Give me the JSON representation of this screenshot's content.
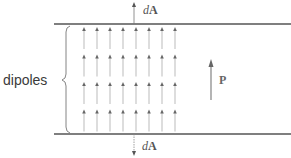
{
  "figure": {
    "labels": {
      "dipoles": "dipoles",
      "polarization": "P",
      "area_top_d": "d",
      "area_top_A": "A",
      "area_bottom_d": "d",
      "area_bottom_A": "A"
    },
    "colors": {
      "boundary_line": "#555555",
      "dipole_arrow": "#777777",
      "polarization_arrow": "#666666",
      "text": "#444444"
    },
    "dipole_grid": {
      "columns": 8,
      "rows": 4,
      "direction": "up"
    },
    "icons": {
      "top_area_vector": "arrow-up-icon",
      "bottom_area_vector": "arrow-down-icon",
      "polarization_vector": "arrow-up-icon",
      "brace": "left-curly-brace-icon"
    }
  }
}
